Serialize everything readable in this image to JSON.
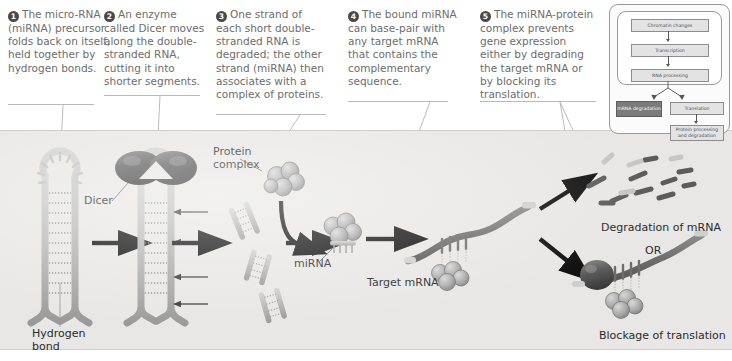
{
  "figure": {
    "panel_bg": "#e8e7e5",
    "text_color": "#6d6d6d"
  },
  "steps": [
    {
      "number": "1",
      "text": "The micro-RNA (miRNA) precursor folds back on itself, held together by hydrogen bonds."
    },
    {
      "number": "2",
      "text": "An enzyme called Dicer moves along the double-stranded RNA, cutting it into shorter segments."
    },
    {
      "number": "3",
      "text": "One strand of each short double-stranded RNA is degraded; the other strand (miRNA) then associates with a complex of proteins."
    },
    {
      "number": "4",
      "text": "The bound miRNA can base-pair with any target mRNA that contains the complementary sequence."
    },
    {
      "number": "5",
      "text": "The miRNA-protein complex prevents gene expression either by degrading the target mRNA or by blocking its translation."
    }
  ],
  "diagram_labels": {
    "hydrogen_bond": "Hydrogen\nbond",
    "hydrogen_bond_line1": "Hydrogen",
    "hydrogen_bond_line2": "bond",
    "dicer": "Dicer",
    "protein_complex_line1": "Protein",
    "protein_complex_line2": "complex",
    "mirna": "miRNA",
    "target_mrna": "Target mRNA",
    "degradation": "Degradation of mRNA",
    "or": "OR",
    "blockage": "Blockage of translation"
  },
  "inset_flowchart": {
    "boxes": [
      {
        "label": "Chromatin changes",
        "style": "light"
      },
      {
        "label": "Transcription",
        "style": "light"
      },
      {
        "label": "RNA processing",
        "style": "light"
      },
      {
        "label": "mRNA degradation",
        "style": "dark"
      },
      {
        "label": "Translation",
        "style": "light"
      },
      {
        "label": "Protein processing and degradation",
        "style": "light"
      }
    ]
  }
}
